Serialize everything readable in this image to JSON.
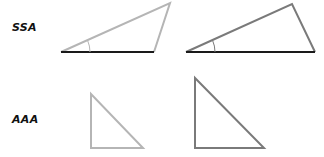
{
  "rows": [
    {
      "label": "SSA"
    },
    {
      "label": "AAA"
    }
  ],
  "colors": {
    "light_line": "#b5b5b5",
    "dark_line": "#7a7a7a",
    "base_line": "#1a1a1a"
  }
}
